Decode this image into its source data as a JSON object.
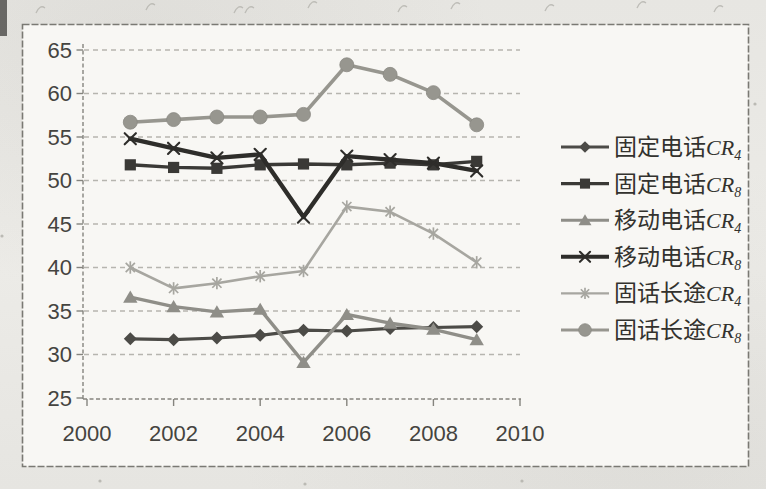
{
  "page": {
    "background_color": "#e7e6e2",
    "paper_color": "#f8f7f4",
    "frame_border_color": "#7a7973",
    "gridline_color": "#b6b5af",
    "axis_color": "#85847e",
    "axis_text_color": "#454440",
    "legend_text_color": "#33322e"
  },
  "chart_data": {
    "type": "line",
    "title": "",
    "xlabel": "",
    "ylabel": "",
    "x": [
      2001,
      2002,
      2003,
      2004,
      2005,
      2006,
      2007,
      2008,
      2009
    ],
    "x_axis": {
      "min": 2000,
      "max": 2010,
      "ticks": [
        2000,
        2002,
        2004,
        2006,
        2008,
        2010
      ]
    },
    "y_axis": {
      "min": 25,
      "max": 65,
      "tick_step": 5,
      "ticks": [
        25,
        30,
        35,
        40,
        45,
        50,
        55,
        60,
        65
      ]
    },
    "grid": "horizontal-dashed",
    "legend_position": "right",
    "series": [
      {
        "id": "fixed-phone-cr4",
        "label_prefix": "固定电话",
        "label_var": "CR",
        "label_sub": "4",
        "marker": "diamond",
        "color": "#4c4b47",
        "line_width": 3.2,
        "values": [
          31.8,
          31.7,
          31.9,
          32.2,
          32.8,
          32.7,
          33.0,
          33.1,
          33.2
        ]
      },
      {
        "id": "fixed-phone-cr8",
        "label_prefix": "固定电话",
        "label_var": "CR",
        "label_sub": "8",
        "marker": "square",
        "color": "#3a3936",
        "line_width": 3.4,
        "values": [
          51.8,
          51.5,
          51.4,
          51.8,
          51.9,
          51.8,
          52.0,
          51.8,
          52.2
        ]
      },
      {
        "id": "mobile-phone-cr4",
        "label_prefix": "移动电话",
        "label_var": "CR",
        "label_sub": "4",
        "marker": "triangle",
        "color": "#8f8e88",
        "line_width": 3.4,
        "values": [
          36.6,
          35.5,
          34.9,
          35.2,
          29.1,
          34.6,
          33.6,
          32.9,
          31.7
        ]
      },
      {
        "id": "mobile-phone-cr8",
        "label_prefix": "移动电话",
        "label_var": "CR",
        "label_sub": "8",
        "marker": "x",
        "color": "#2e2d2a",
        "line_width": 4.4,
        "values": [
          54.8,
          53.7,
          52.6,
          53.0,
          45.8,
          52.8,
          52.4,
          52.0,
          51.1
        ]
      },
      {
        "id": "fixedline-longdistance-cr4",
        "label_prefix": "固话长途",
        "label_var": "CR",
        "label_sub": "4",
        "marker": "asterisk",
        "color": "#a7a6a0",
        "line_width": 2.6,
        "values": [
          40.0,
          37.6,
          38.2,
          39.0,
          39.6,
          47.0,
          46.4,
          43.9,
          40.6
        ]
      },
      {
        "id": "fixedline-longdistance-cr8",
        "label_prefix": "固话长途",
        "label_var": "CR",
        "label_sub": "8",
        "marker": "circle",
        "color": "#97968f",
        "line_width": 3.6,
        "values": [
          56.7,
          57.0,
          57.3,
          57.3,
          57.6,
          63.3,
          62.2,
          60.1,
          56.4
        ]
      }
    ]
  }
}
